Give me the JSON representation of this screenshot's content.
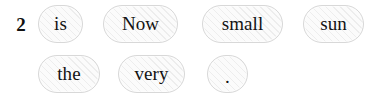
{
  "board": {
    "row_label": "2",
    "background_color": "#ffffff",
    "token_border_color": "#d8d8d8",
    "token_fill_color": "#fbfbfb",
    "token_text_color": "#131313",
    "label_color": "#111111"
  },
  "rows": [
    {
      "label": "2",
      "tokens": [
        {
          "text": "is",
          "x": 38,
          "y": 5,
          "width": 45,
          "height": 38
        },
        {
          "text": "Now",
          "x": 103,
          "y": 5,
          "width": 75,
          "height": 38
        },
        {
          "text": "small",
          "x": 202,
          "y": 5,
          "width": 81,
          "height": 38
        },
        {
          "text": "sun",
          "x": 303,
          "y": 5,
          "width": 61,
          "height": 38
        }
      ]
    },
    {
      "label": "",
      "tokens": [
        {
          "text": "the",
          "x": 38,
          "y": 55,
          "width": 62,
          "height": 38
        },
        {
          "text": "very",
          "x": 118,
          "y": 55,
          "width": 67,
          "height": 38
        },
        {
          "text": ".",
          "x": 207,
          "y": 55,
          "width": 41,
          "height": 38
        }
      ]
    }
  ]
}
